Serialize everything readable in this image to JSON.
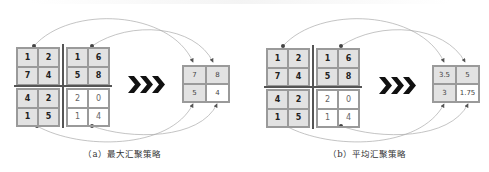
{
  "panels": [
    {
      "caption": "（a）最大汇聚策略",
      "strategy": "max-pooling",
      "input": {
        "top_left": [
          "1",
          "2",
          "7",
          "4"
        ],
        "top_right": [
          "1",
          "6",
          "5",
          "8"
        ],
        "bottom_left": [
          "4",
          "2",
          "1",
          "5"
        ],
        "bottom_right": [
          "2",
          "0",
          "1",
          "4"
        ]
      },
      "output": [
        "7",
        "8",
        "5",
        "4"
      ]
    },
    {
      "caption": "（b）平均汇聚策略",
      "strategy": "average-pooling",
      "input": {
        "top_left": [
          "1",
          "2",
          "7",
          "4"
        ],
        "top_right": [
          "1",
          "6",
          "5",
          "8"
        ],
        "bottom_left": [
          "4",
          "2",
          "1",
          "5"
        ],
        "bottom_right": [
          "2",
          "0",
          "1",
          "4"
        ]
      },
      "output": [
        "3.5",
        "5",
        "3",
        "1.75"
      ]
    }
  ],
  "colors": {
    "shaded_cell": "#e2e2e2",
    "grid_line": "#9a9a9a",
    "divider": "#555555",
    "chevron": "#111111",
    "arrow": "#777777"
  }
}
